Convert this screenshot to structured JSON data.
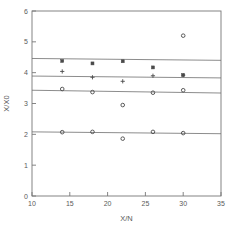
{
  "chart_data": {
    "type": "scatter",
    "title": "",
    "xlabel": "X/N",
    "ylabel": "X/X0",
    "xlim": [
      10,
      35
    ],
    "ylim": [
      0,
      6
    ],
    "xticks": [
      10,
      15,
      20,
      25,
      30,
      35
    ],
    "yticks": [
      0,
      1,
      2,
      3,
      4,
      5,
      6
    ],
    "xtick_labels": [
      "10",
      "15",
      "20",
      "25",
      "30",
      "35"
    ],
    "ytick_labels": [
      "0",
      "1",
      "2",
      "3",
      "4",
      "5",
      "6"
    ],
    "grid": false,
    "legend": "none",
    "frame": "box",
    "marker_color": "#4a4a4a",
    "line_color": "#6e6e6e",
    "axis_color": "#777777",
    "series": [
      {
        "name": "series-1",
        "marker": "square",
        "x": [
          14,
          18,
          22,
          26,
          30
        ],
        "y": [
          4.38,
          4.3,
          4.37,
          4.17,
          3.92
        ],
        "fit_line": {
          "x": [
            10,
            35
          ],
          "y": [
            4.46,
            4.4
          ]
        }
      },
      {
        "name": "series-2",
        "marker": "cross",
        "x": [
          14,
          18,
          22,
          26,
          30
        ],
        "y": [
          4.04,
          3.85,
          3.72,
          3.9,
          3.92
        ],
        "fit_line": {
          "x": [
            10,
            35
          ],
          "y": [
            3.89,
            3.83
          ]
        }
      },
      {
        "name": "series-3",
        "marker": "circle",
        "x": [
          14,
          18,
          22,
          26,
          30
        ],
        "y": [
          3.47,
          3.37,
          2.95,
          3.35,
          3.43
        ],
        "fit_line": {
          "x": [
            10,
            35
          ],
          "y": [
            3.43,
            3.34
          ]
        }
      },
      {
        "name": "series-4",
        "marker": "circle",
        "x": [
          14,
          18,
          22,
          26,
          30
        ],
        "y": [
          2.07,
          2.08,
          1.86,
          2.08,
          2.04
        ],
        "fit_line": {
          "x": [
            10,
            35
          ],
          "y": [
            2.08,
            2.02
          ]
        }
      },
      {
        "name": "outlier",
        "marker": "circle",
        "x": [
          30
        ],
        "y": [
          5.2
        ],
        "fit_line": null
      }
    ]
  }
}
